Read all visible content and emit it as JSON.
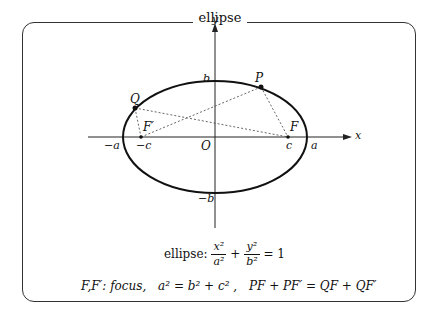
{
  "title": "ellipse",
  "diagram": {
    "axes": {
      "x_label": "x",
      "y_label": "y",
      "origin_label": "O"
    },
    "tick_labels": {
      "neg_a": "−a",
      "neg_c": "−c",
      "c": "c",
      "a": "a",
      "b": "b",
      "neg_b": "−b"
    },
    "points": {
      "P": "P",
      "Q": "Q",
      "F": "F",
      "F_prime": "F′"
    },
    "colors": {
      "stroke": "#111111",
      "dashed": "#555555",
      "frame": "#333333"
    }
  },
  "formulas": {
    "equation_prefix": "ellipse:",
    "eq_num1": "x²",
    "eq_den1": "a²",
    "eq_plus": "+",
    "eq_num2": "y²",
    "eq_den2": "b²",
    "eq_rhs": "= 1",
    "line2_focus": "F,F′: focus,",
    "line2_rel": "a² = b² + c² ,",
    "line2_sum": "PF + PF′ = QF + QF′"
  }
}
